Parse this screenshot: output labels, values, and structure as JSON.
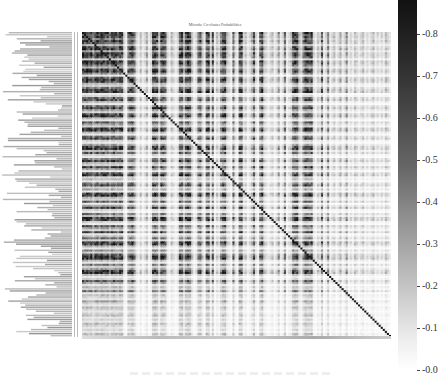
{
  "chart_data": {
    "type": "heatmap",
    "title": "Microbe Co-cluster Probabilities",
    "xlabel": "",
    "ylabel": "",
    "n": 150,
    "colormap": "greys",
    "value_range": [
      0.0,
      0.88
    ],
    "diagonal_value": 0.88,
    "colorbar": {
      "ticks": [
        0.8,
        0.7,
        0.6,
        0.5,
        0.4,
        0.3,
        0.2,
        0.1,
        0.0
      ],
      "tick_labels": [
        "-0.8",
        "-0.7",
        "-0.6",
        "-0.5",
        "-0.4",
        "-0.3",
        "-0.2",
        "-0.1",
        "-0.0"
      ]
    },
    "row_profile": [
      0.9,
      0.8,
      0.85,
      0.6,
      0.9,
      0.7,
      0.3,
      0.8,
      0.9,
      0.4,
      0.85,
      0.9,
      0.7,
      0.2,
      0.9,
      0.85,
      0.6,
      0.3,
      0.8,
      0.9,
      0.5,
      0.1,
      0.7,
      0.9,
      0.8,
      0.3,
      0.2,
      0.6,
      0.85,
      0.9,
      0.1,
      0.2,
      0.7,
      0.8,
      0.3,
      0.1,
      0.6,
      0.85,
      0.4,
      0.2,
      0.8,
      0.9,
      0.3,
      0.1,
      0.7,
      0.4,
      0.2,
      0.85,
      0.9,
      0.3,
      0.1,
      0.6,
      0.8,
      0.2,
      0.1,
      0.4,
      0.8,
      0.9,
      0.3,
      0.7,
      0.2,
      0.1,
      0.6,
      0.85,
      0.3,
      0.2,
      0.8,
      0.4,
      0.1,
      0.7,
      0.9,
      0.2,
      0.3,
      0.1,
      0.6,
      0.8,
      0.2,
      0.4,
      0.1,
      0.85,
      0.9,
      0.3,
      0.2,
      0.7,
      0.1,
      0.4,
      0.8,
      0.2,
      0.1,
      0.6,
      0.3,
      0.9,
      0.85,
      0.2,
      0.1,
      0.7,
      0.4,
      0.2,
      0.8,
      0.1,
      0.3,
      0.6,
      0.2,
      0.9,
      0.8,
      0.3,
      0.1,
      0.5,
      0.2,
      0.7,
      0.9,
      0.85,
      0.3,
      0.1,
      0.6,
      0.2,
      0.4,
      0.8,
      0.9,
      0.3,
      0.1,
      0.2,
      0.7,
      0.4,
      0.1,
      0.3,
      0.2,
      0.6,
      0.1,
      0.3,
      0.2,
      0.1,
      0.4,
      0.2,
      0.1,
      0.3,
      0.2,
      0.1,
      0.2,
      0.3,
      0.1,
      0.2,
      0.1,
      0.3,
      0.2,
      0.1,
      0.2,
      0.1,
      0.3,
      0.2
    ],
    "col_profile": [
      0.9,
      0.85,
      0.9,
      0.8,
      0.9,
      0.6,
      0.85,
      0.9,
      0.7,
      0.9,
      0.85,
      0.8,
      0.9,
      0.6,
      0.85,
      0.9,
      0.8,
      0.7,
      0.9,
      0.85,
      0.2,
      0.1,
      0.7,
      0.8,
      0.9,
      0.6,
      0.2,
      0.1,
      0.3,
      0.1,
      0.2,
      0.4,
      0.1,
      0.2,
      0.85,
      0.9,
      0.8,
      0.3,
      0.9,
      0.85,
      0.7,
      0.2,
      0.1,
      0.3,
      0.2,
      0.1,
      0.2,
      0.85,
      0.9,
      0.4,
      0.8,
      0.9,
      0.85,
      0.3,
      0.1,
      0.2,
      0.7,
      0.8,
      0.3,
      0.1,
      0.85,
      0.9,
      0.2,
      0.8,
      0.1,
      0.3,
      0.2,
      0.6,
      0.85,
      0.9,
      0.3,
      0.2,
      0.1,
      0.7,
      0.2,
      0.1,
      0.85,
      0.9,
      0.2,
      0.3,
      0.1,
      0.2,
      0.4,
      0.8,
      0.2,
      0.1,
      0.7,
      0.9,
      0.3,
      0.2,
      0.1,
      0.2,
      0.3,
      0.1,
      0.2,
      0.5,
      0.1,
      0.2,
      0.7,
      0.1,
      0.2,
      0.3,
      0.8,
      0.85,
      0.9,
      0.3,
      0.2,
      0.6,
      0.9,
      0.85,
      0.8,
      0.9,
      0.2,
      0.1,
      0.3,
      0.2,
      0.7,
      0.1,
      0.2,
      0.6,
      0.1,
      0.2,
      0.3,
      0.1,
      0.2,
      0.4,
      0.1,
      0.2,
      0.5,
      0.1,
      0.2,
      0.1,
      0.3,
      0.2,
      0.1,
      0.2,
      0.3,
      0.1,
      0.2,
      0.1,
      0.2,
      0.3,
      0.1,
      0.2,
      0.1,
      0.2,
      0.1,
      0.3,
      0.2,
      0.1
    ],
    "row_labels_visible": false
  }
}
